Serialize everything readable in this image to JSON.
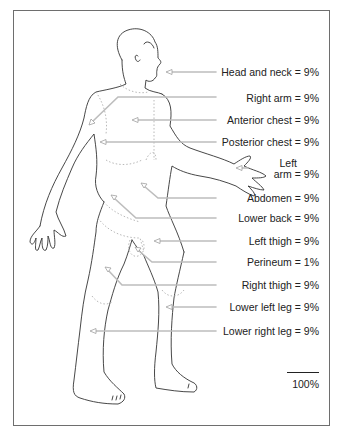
{
  "figure": {
    "labels": [
      {
        "id": "head-neck",
        "text": "Head and neck = 9%"
      },
      {
        "id": "right-arm",
        "text": "Right arm = 9%"
      },
      {
        "id": "anterior-chest",
        "text": "Anterior chest = 9%"
      },
      {
        "id": "posterior-chest",
        "text": "Posterior chest = 9%"
      },
      {
        "id": "left-arm",
        "line1": "Left",
        "line2": "arm = 9%"
      },
      {
        "id": "abdomen",
        "text": "Abdomen = 9%"
      },
      {
        "id": "lower-back",
        "text": "Lower back = 9%"
      },
      {
        "id": "left-thigh",
        "text": "Left thigh = 9%"
      },
      {
        "id": "perineum",
        "text": "Perineum = 1%"
      },
      {
        "id": "right-thigh",
        "text": "Right thigh = 9%"
      },
      {
        "id": "lower-left-leg",
        "text": "Lower left leg = 9%"
      },
      {
        "id": "lower-right-leg",
        "text": "Lower right leg = 9%"
      }
    ],
    "total": "100%"
  },
  "colors": {
    "outline": "#333333",
    "leader": "#bdbdbd",
    "dotted": "#b0b0b0",
    "frame": "#6e6e6e"
  }
}
